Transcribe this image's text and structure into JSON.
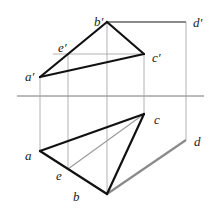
{
  "diagram": {
    "type": "orthographic-projection",
    "axis": {
      "x1": 17,
      "y1": 96,
      "x2": 204,
      "y2": 96
    },
    "points": {
      "a_prime": {
        "label": "a′",
        "x": 40,
        "y": 77,
        "lx": 25,
        "ly": 81
      },
      "b_prime": {
        "label": "b′",
        "x": 107,
        "y": 22,
        "lx": 94,
        "ly": 26
      },
      "c_prime": {
        "label": "c′",
        "x": 144,
        "y": 54,
        "lx": 152,
        "ly": 62
      },
      "d_prime": {
        "label": "d′",
        "x": 186,
        "y": 22,
        "lx": 193,
        "ly": 27
      },
      "e_prime": {
        "label": "e′",
        "x": 68,
        "y": 54,
        "lx": 58,
        "ly": 52
      },
      "a": {
        "label": "a",
        "x": 40,
        "y": 151,
        "lx": 25,
        "ly": 160
      },
      "b": {
        "label": "b",
        "x": 107,
        "y": 194,
        "lx": 73,
        "ly": 201
      },
      "c": {
        "label": "c",
        "x": 144,
        "y": 114,
        "lx": 154,
        "ly": 124
      },
      "d": {
        "label": "d",
        "x": 186,
        "y": 140,
        "lx": 194,
        "ly": 146
      },
      "e": {
        "label": "e",
        "x": 68,
        "y": 169,
        "lx": 56,
        "ly": 180
      }
    },
    "colors": {
      "edge": "#111111",
      "gray_edge": "#8a8a8a",
      "projection": "#9a9a9a",
      "axis": "#555555"
    }
  }
}
